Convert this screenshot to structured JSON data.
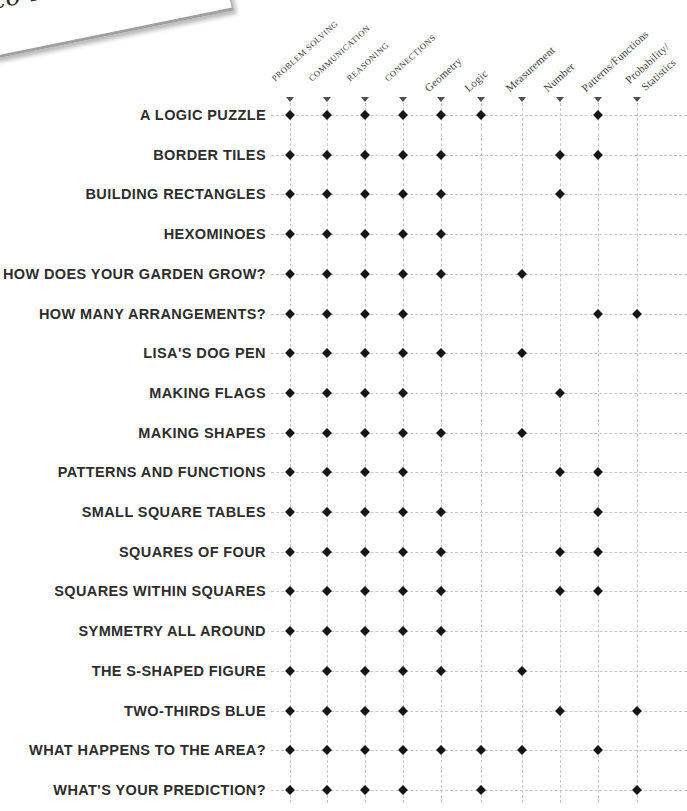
{
  "page": {
    "corner_text": "to N"
  },
  "colors": {
    "mark": "#151515",
    "grid_line": "#c7c7c7",
    "text": "#2d2d2d",
    "header_text": "#3d3d3d",
    "triangle": "#4f4f4f",
    "corner_edge": "#a0a0a0"
  },
  "chart_data": {
    "type": "table",
    "subtype": "activity-strand-correlation-matrix",
    "mark_glyph": "diamond",
    "columns": [
      {
        "label": "PROBLEM SOLVING",
        "style": "process",
        "lines": [
          "PROBLEM SOLVING"
        ]
      },
      {
        "label": "COMMUNICATION",
        "style": "process",
        "lines": [
          "COMMUNICATION"
        ]
      },
      {
        "label": "REASONING",
        "style": "process",
        "lines": [
          "REASONING"
        ]
      },
      {
        "label": "CONNECTIONS",
        "style": "process",
        "lines": [
          "CONNECTIONS"
        ]
      },
      {
        "label": "Geometry",
        "style": "content",
        "lines": [
          "Geometry"
        ]
      },
      {
        "label": "Logic",
        "style": "content",
        "lines": [
          "Logic"
        ]
      },
      {
        "label": "Measurement",
        "style": "content",
        "lines": [
          "Measurement"
        ]
      },
      {
        "label": "Number",
        "style": "content",
        "lines": [
          "Number"
        ]
      },
      {
        "label": "Patterns/Functions",
        "style": "content",
        "lines": [
          "Patterns/Functions"
        ]
      },
      {
        "label": "Probability/Statistics",
        "style": "content",
        "lines": [
          "Probability/",
          "Statistics"
        ]
      }
    ],
    "rows": [
      {
        "label": "A LOGIC PUZZLE",
        "marks": [
          1,
          1,
          1,
          1,
          1,
          1,
          0,
          0,
          1,
          0
        ]
      },
      {
        "label": "BORDER TILES",
        "marks": [
          1,
          1,
          1,
          1,
          1,
          0,
          0,
          1,
          1,
          0
        ]
      },
      {
        "label": "BUILDING RECTANGLES",
        "marks": [
          1,
          1,
          1,
          1,
          1,
          0,
          0,
          1,
          0,
          0
        ]
      },
      {
        "label": "HEXOMINOES",
        "marks": [
          1,
          1,
          1,
          1,
          1,
          0,
          0,
          0,
          0,
          0
        ]
      },
      {
        "label": "HOW DOES YOUR GARDEN GROW?",
        "marks": [
          1,
          1,
          1,
          1,
          1,
          0,
          1,
          0,
          0,
          0
        ]
      },
      {
        "label": "HOW MANY ARRANGEMENTS?",
        "marks": [
          1,
          1,
          1,
          1,
          0,
          0,
          0,
          0,
          1,
          1
        ]
      },
      {
        "label": "LISA'S DOG PEN",
        "marks": [
          1,
          1,
          1,
          1,
          1,
          0,
          1,
          0,
          0,
          0
        ]
      },
      {
        "label": "MAKING FLAGS",
        "marks": [
          1,
          1,
          1,
          1,
          0,
          0,
          0,
          1,
          0,
          0
        ]
      },
      {
        "label": "MAKING SHAPES",
        "marks": [
          1,
          1,
          1,
          1,
          1,
          0,
          1,
          0,
          0,
          0
        ]
      },
      {
        "label": "PATTERNS AND FUNCTIONS",
        "marks": [
          1,
          1,
          1,
          1,
          0,
          0,
          0,
          1,
          1,
          0
        ]
      },
      {
        "label": "SMALL SQUARE TABLES",
        "marks": [
          1,
          1,
          1,
          1,
          1,
          0,
          0,
          0,
          1,
          0
        ]
      },
      {
        "label": "SQUARES OF FOUR",
        "marks": [
          1,
          1,
          1,
          1,
          1,
          0,
          0,
          1,
          1,
          0
        ]
      },
      {
        "label": "SQUARES WITHIN SQUARES",
        "marks": [
          1,
          1,
          1,
          1,
          1,
          0,
          0,
          1,
          1,
          0
        ]
      },
      {
        "label": "SYMMETRY ALL AROUND",
        "marks": [
          1,
          1,
          1,
          1,
          1,
          0,
          0,
          0,
          0,
          0
        ]
      },
      {
        "label": "THE S-SHAPED FIGURE",
        "marks": [
          1,
          1,
          1,
          1,
          1,
          0,
          1,
          0,
          0,
          0
        ]
      },
      {
        "label": "TWO-THIRDS BLUE",
        "marks": [
          1,
          1,
          1,
          1,
          0,
          0,
          0,
          1,
          0,
          1
        ]
      },
      {
        "label": "WHAT HAPPENS TO THE AREA?",
        "marks": [
          1,
          1,
          1,
          1,
          1,
          1,
          1,
          0,
          1,
          0
        ]
      },
      {
        "label": "WHAT'S YOUR PREDICTION?",
        "marks": [
          1,
          1,
          1,
          1,
          0,
          1,
          0,
          0,
          0,
          1
        ]
      }
    ],
    "title": "",
    "legend_position": "none",
    "grid": "dashed"
  }
}
